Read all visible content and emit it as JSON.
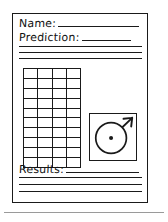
{
  "document": {
    "type": "worksheet",
    "style": "hand-drawn",
    "ink_color": "#1a1a1a",
    "paper_color": "#ffffff",
    "separator_color": "#9a9a9a"
  },
  "fields": [
    {
      "name": "name",
      "label": "Name:",
      "value": "",
      "has_blank_line": true
    },
    {
      "name": "prediction",
      "label": "Prediction:",
      "value": "",
      "has_blank_line": true
    },
    {
      "name": "results",
      "label": "Results:",
      "value": "",
      "has_blank_line": true
    }
  ],
  "prediction_lines": {
    "count": 3,
    "values": [
      "",
      "",
      ""
    ]
  },
  "results_lines": {
    "count": 3,
    "values": [
      "",
      "",
      ""
    ]
  },
  "data_grid": {
    "label": "data-recording-grid",
    "columns": 4,
    "rows": 10,
    "cells": [
      [
        "",
        "",
        "",
        ""
      ],
      [
        "",
        "",
        "",
        ""
      ],
      [
        "",
        "",
        "",
        ""
      ],
      [
        "",
        "",
        "",
        ""
      ],
      [
        "",
        "",
        "",
        ""
      ],
      [
        "",
        "",
        "",
        ""
      ],
      [
        "",
        "",
        "",
        ""
      ],
      [
        "",
        "",
        "",
        ""
      ],
      [
        "",
        "",
        "",
        ""
      ],
      [
        "",
        "",
        "",
        ""
      ]
    ]
  },
  "spinner_diagram": {
    "label": "spinner-diagram",
    "shape": "circle-in-square",
    "has_center_dot": true,
    "pointer": "radius-line-to-upper-right",
    "pointer_angle_deg": 45
  },
  "icons": {
    "circle": "circle-icon",
    "center_dot": "center-dot-icon",
    "pointer": "pointer-line-icon"
  }
}
